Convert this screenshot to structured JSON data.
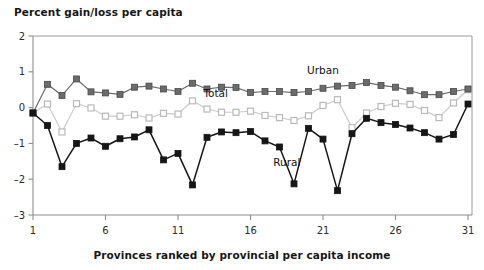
{
  "chart_data": {
    "type": "line",
    "title": "",
    "ylabel": "Percent gain/loss per capita",
    "xlabel": "Provinces ranked by provincial per capita income",
    "x": [
      1,
      2,
      3,
      4,
      5,
      6,
      7,
      8,
      9,
      10,
      11,
      12,
      13,
      14,
      15,
      16,
      17,
      18,
      19,
      20,
      21,
      22,
      23,
      24,
      25,
      26,
      27,
      28,
      29,
      30,
      31
    ],
    "xlim": [
      1,
      31
    ],
    "ylim": [
      -3,
      2
    ],
    "xticks": [
      1,
      6,
      11,
      16,
      21,
      26,
      31
    ],
    "xticklabels": [
      "1",
      "6",
      "11",
      "16",
      "21",
      "26",
      "31"
    ],
    "yticks": [
      2,
      1,
      0,
      -1,
      -2,
      -3
    ],
    "yticklabels": [
      "2",
      "1",
      "0",
      "–1",
      "–2",
      "–3"
    ],
    "grid": false,
    "legend_position": "inline-annotations",
    "series": [
      {
        "name": "Urban",
        "color": "#6b6b6b",
        "marker": "square",
        "label_x": 21.0,
        "label_y": 0.95,
        "values": [
          -0.15,
          0.65,
          0.34,
          0.8,
          0.44,
          0.41,
          0.37,
          0.57,
          0.6,
          0.52,
          0.45,
          0.68,
          0.52,
          0.57,
          0.56,
          0.42,
          0.45,
          0.45,
          0.42,
          0.45,
          0.54,
          0.6,
          0.62,
          0.7,
          0.62,
          0.57,
          0.47,
          0.36,
          0.36,
          0.45,
          0.52
        ]
      },
      {
        "name": "Total",
        "color": "#cccccc",
        "marker": "square-open",
        "label_x": 13.6,
        "label_y": 0.3,
        "values": [
          -0.15,
          0.1,
          -0.68,
          0.11,
          -0.01,
          -0.24,
          -0.24,
          -0.2,
          -0.29,
          -0.16,
          -0.18,
          0.19,
          -0.04,
          -0.13,
          -0.13,
          -0.1,
          -0.22,
          -0.28,
          -0.36,
          -0.23,
          0.06,
          0.22,
          -0.56,
          -0.15,
          0.03,
          0.12,
          0.09,
          -0.08,
          -0.28,
          0.13,
          0.5
        ]
      },
      {
        "name": "Rural",
        "color": "#161616",
        "marker": "square-filled",
        "label_x": 18.5,
        "label_y": -1.62,
        "values": [
          -0.15,
          -0.5,
          -1.65,
          -1.0,
          -0.85,
          -1.08,
          -0.87,
          -0.82,
          -0.62,
          -1.46,
          -1.28,
          -2.16,
          -0.83,
          -0.68,
          -0.7,
          -0.67,
          -0.93,
          -1.1,
          -2.13,
          -0.58,
          -0.88,
          -2.32,
          -0.73,
          -0.3,
          -0.42,
          -0.47,
          -0.57,
          -0.7,
          -0.88,
          -0.75,
          0.1
        ]
      }
    ]
  }
}
